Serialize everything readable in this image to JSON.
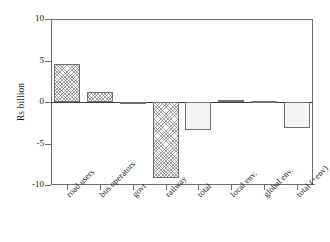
{
  "chart_data": {
    "type": "bar",
    "title": "",
    "xlabel": "",
    "ylabel": "Rs billion",
    "ylim": [
      -10,
      10
    ],
    "yticks": [
      10,
      5,
      0,
      -5,
      -10
    ],
    "ytick_labels": [
      "10",
      "5",
      "0",
      "-5",
      "-10"
    ],
    "grid": false,
    "legend": "none",
    "categories": [
      "road users",
      "bus operators",
      "govt",
      "railway",
      "total",
      "local env.",
      "global env.",
      "total (+env)"
    ],
    "values": [
      4.6,
      1.2,
      -0.1,
      -9.1,
      -3.4,
      0.3,
      0.1,
      -3.1
    ],
    "bar_styles": [
      "hatched",
      "hatched",
      "hatched",
      "hatched",
      "plain",
      "plain",
      "plain",
      "plain"
    ],
    "annotations": []
  },
  "axis": {
    "y_title": "Rs billion",
    "tick_labels": [
      "10",
      "5",
      "0",
      "-5",
      "-10"
    ]
  },
  "colors": {
    "frame": "#6e6e6e",
    "zero_line": "#3b3b3b",
    "bar_outline": "#707070",
    "hatch": "#5a5a5a",
    "plain_fill": "#f4f4f2",
    "text": "#1a1a1a",
    "background": "#ffffff"
  }
}
